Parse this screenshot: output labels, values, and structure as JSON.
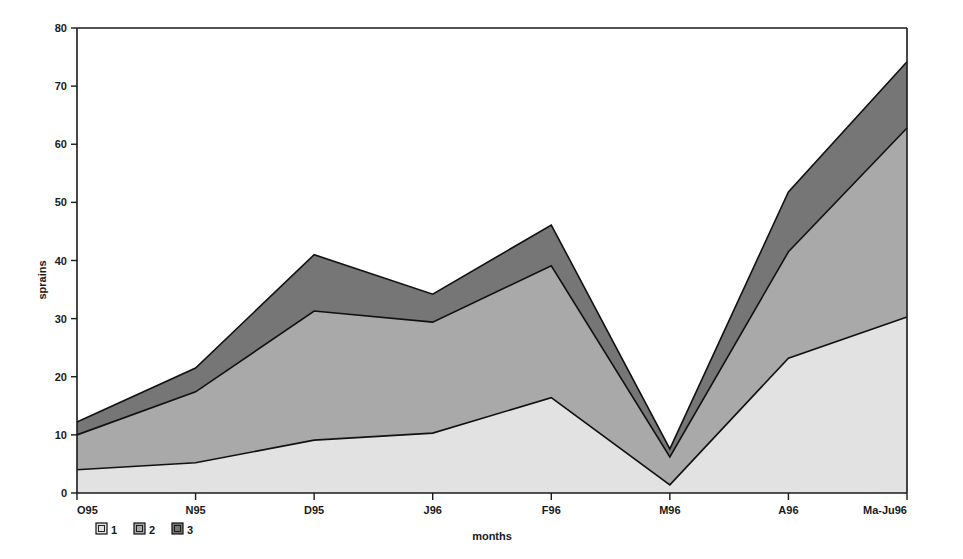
{
  "chart_data": {
    "type": "area",
    "stacked": true,
    "title": "",
    "xlabel": "months",
    "ylabel": "sprains",
    "categories": [
      "O95",
      "N95",
      "D95",
      "J96",
      "F96",
      "M96",
      "A96",
      "Ma-Ju96"
    ],
    "ylim": [
      0,
      80
    ],
    "yticks": [
      0,
      10,
      20,
      30,
      40,
      50,
      60,
      70,
      80
    ],
    "ytick_labels": [
      "0",
      "10",
      "20",
      "30",
      "40",
      "50",
      "60",
      "70",
      "80"
    ],
    "grid": false,
    "legend_position": "bottom-left",
    "series": [
      {
        "name": "1",
        "color": "#e2e2e2",
        "values": [
          4.0,
          5.2,
          9.1,
          10.3,
          16.4,
          1.4,
          23.2,
          30.3
        ]
      },
      {
        "name": "2",
        "color": "#a9a9a9",
        "values": [
          6.0,
          12.2,
          22.2,
          19.1,
          22.7,
          4.8,
          18.3,
          32.5
        ]
      },
      {
        "name": "3",
        "color": "#767676",
        "values": [
          2.2,
          4.1,
          9.7,
          4.8,
          7.0,
          1.4,
          10.3,
          11.4
        ]
      }
    ],
    "cumulative": [
      {
        "name": "1",
        "values": [
          4.0,
          5.2,
          9.1,
          10.3,
          16.4,
          1.4,
          23.2,
          30.3
        ]
      },
      {
        "name": "2",
        "values": [
          10.0,
          17.4,
          31.3,
          29.4,
          39.1,
          6.2,
          41.5,
          62.8
        ]
      },
      {
        "name": "3",
        "values": [
          12.2,
          21.5,
          41.0,
          34.2,
          46.1,
          7.6,
          51.8,
          74.2
        ]
      }
    ]
  },
  "legend": {
    "items": [
      {
        "label": "1",
        "color": "#e2e2e2"
      },
      {
        "label": "2",
        "color": "#a9a9a9"
      },
      {
        "label": "3",
        "color": "#767676"
      }
    ]
  },
  "axes": {
    "x_title": "months",
    "y_title": "sprains"
  }
}
